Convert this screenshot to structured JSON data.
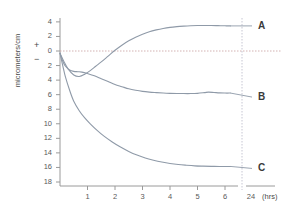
{
  "chart_data": {
    "type": "line",
    "title": "",
    "subtitle": "",
    "xlabel": "(hrs)",
    "ylabel": "micrometers/cm",
    "sign_positive": "+",
    "sign_negative": "−",
    "grid": false,
    "zero_line": true,
    "legend_position": "right-inline",
    "xlim": [
      0,
      6.45
    ],
    "ylim": [
      -18,
      5
    ],
    "x_ticks": [
      1,
      2,
      3,
      4,
      5,
      6
    ],
    "x_tick_labels": [
      "1",
      "2",
      "3",
      "4",
      "5",
      "6"
    ],
    "x_break_label": "24",
    "y_ticks": [
      4,
      2,
      0,
      -2,
      -4,
      -6,
      -8,
      -10,
      -12,
      -14,
      -16,
      -18
    ],
    "y_tick_labels": [
      "4",
      "2",
      "0",
      "2",
      "4",
      "6",
      "8",
      "10",
      "12",
      "14",
      "16",
      "18"
    ],
    "series": [
      {
        "name": "A",
        "label": "A",
        "color": "#8f9aa8",
        "x": [
          0,
          0.15,
          0.3,
          0.5,
          0.7,
          0.9,
          1.1,
          1.3,
          1.5,
          1.75,
          2.0,
          2.25,
          2.5,
          2.75,
          3.0,
          3.25,
          3.5,
          3.75,
          4.0,
          4.25,
          4.5,
          4.75,
          5.0,
          5.25,
          5.5,
          5.75,
          6.0,
          6.2
        ],
        "values": [
          -0.3,
          -1.5,
          -2.5,
          -3.3,
          -3.5,
          -3.2,
          -2.7,
          -2.1,
          -1.5,
          -0.7,
          0.1,
          0.8,
          1.4,
          1.9,
          2.3,
          2.65,
          2.9,
          3.1,
          3.25,
          3.35,
          3.42,
          3.47,
          3.5,
          3.5,
          3.5,
          3.48,
          3.46,
          3.45
        ]
      },
      {
        "name": "B",
        "label": "B",
        "color": "#8f9aa8",
        "x": [
          0,
          0.1,
          0.2,
          0.35,
          0.5,
          0.65,
          0.8,
          1.0,
          1.25,
          1.5,
          1.75,
          2.0,
          2.25,
          2.5,
          2.75,
          3.0,
          3.25,
          3.5,
          3.75,
          4.0,
          4.25,
          4.5,
          4.75,
          5.0,
          5.25,
          5.4,
          5.6,
          5.8,
          6.0,
          6.2
        ],
        "values": [
          -0.3,
          -1.4,
          -2.1,
          -2.6,
          -2.8,
          -2.85,
          -2.9,
          -3.1,
          -3.4,
          -3.8,
          -4.2,
          -4.6,
          -4.9,
          -5.2,
          -5.4,
          -5.55,
          -5.65,
          -5.72,
          -5.78,
          -5.82,
          -5.84,
          -5.85,
          -5.85,
          -5.82,
          -5.72,
          -5.65,
          -5.7,
          -5.76,
          -5.78,
          -5.78
        ]
      },
      {
        "name": "C",
        "label": "C",
        "color": "#8f9aa8",
        "x": [
          0,
          0.1,
          0.2,
          0.35,
          0.5,
          0.7,
          0.9,
          1.1,
          1.35,
          1.6,
          1.9,
          2.2,
          2.5,
          2.8,
          3.1,
          3.4,
          3.7,
          4.0,
          4.3,
          4.6,
          4.9,
          5.2,
          5.5,
          5.8,
          6.0,
          6.2
        ],
        "values": [
          -0.3,
          -2.0,
          -3.6,
          -5.4,
          -6.9,
          -8.2,
          -9.2,
          -10.0,
          -10.9,
          -11.7,
          -12.5,
          -13.2,
          -13.8,
          -14.3,
          -14.7,
          -15.0,
          -15.25,
          -15.45,
          -15.6,
          -15.7,
          -15.78,
          -15.82,
          -15.85,
          -15.86,
          -15.86,
          -15.86
        ]
      }
    ],
    "annotations": []
  }
}
